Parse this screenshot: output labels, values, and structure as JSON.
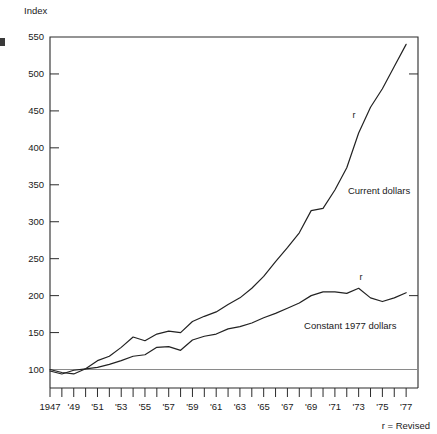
{
  "chart_data": {
    "type": "line",
    "title": "",
    "ylabel": "Index",
    "xlabel": "",
    "ylim": [
      75,
      550
    ],
    "yticks": [
      100,
      150,
      200,
      250,
      300,
      350,
      400,
      450,
      500,
      550
    ],
    "xlim": [
      1947,
      1978
    ],
    "xticks": [
      1947,
      1948,
      1949,
      1950,
      1951,
      1952,
      1953,
      1954,
      1955,
      1956,
      1957,
      1958,
      1959,
      1960,
      1961,
      1962,
      1963,
      1964,
      1965,
      1966,
      1967,
      1968,
      1969,
      1970,
      1971,
      1972,
      1973,
      1974,
      1975,
      1976,
      1977
    ],
    "xticklabels": [
      "1947",
      "",
      "'49",
      "",
      "'51",
      "",
      "'53",
      "",
      "'55",
      "",
      "'57",
      "",
      "'59",
      "",
      "'61",
      "",
      "'63",
      "",
      "'65",
      "",
      "'67",
      "",
      "'69",
      "",
      "'71",
      "",
      "'73",
      "",
      "'75",
      "",
      "'77"
    ],
    "grid": false,
    "baseline_value": 100,
    "legend_position": "inline-annotation",
    "annotations": [
      {
        "text": "Current dollars",
        "x": 1972.1,
        "y": 337,
        "name": "current-dollars-label"
      },
      {
        "text": "Constant 1977 dollars",
        "x": 1968.4,
        "y": 155,
        "name": "constant-dollars-label"
      },
      {
        "text": "r",
        "x": 1972.6,
        "y": 441,
        "name": "revised-flag-current"
      },
      {
        "text": "r",
        "x": 1973.2,
        "y": 221,
        "name": "revised-flag-constant"
      }
    ],
    "footnote": "r = Revised",
    "series": [
      {
        "name": "Current dollars",
        "x": [
          1947,
          1948,
          1949,
          1950,
          1951,
          1952,
          1953,
          1954,
          1955,
          1956,
          1957,
          1958,
          1959,
          1960,
          1961,
          1962,
          1963,
          1964,
          1965,
          1966,
          1967,
          1968,
          1969,
          1970,
          1971,
          1972,
          1973,
          1974,
          1975,
          1976,
          1977
        ],
        "values": [
          100,
          96,
          94,
          101,
          112,
          118,
          130,
          144,
          139,
          148,
          152,
          150,
          165,
          172,
          178,
          188,
          197,
          210,
          226,
          246,
          265,
          285,
          315,
          318,
          343,
          373,
          420,
          455,
          480,
          510,
          540
        ]
      },
      {
        "name": "Constant 1977 dollars",
        "x": [
          1947,
          1948,
          1949,
          1950,
          1951,
          1952,
          1953,
          1954,
          1955,
          1956,
          1957,
          1958,
          1959,
          1960,
          1961,
          1962,
          1963,
          1964,
          1965,
          1966,
          1967,
          1968,
          1969,
          1970,
          1971,
          1972,
          1973,
          1974,
          1975,
          1976,
          1977
        ],
        "values": [
          98,
          94,
          99,
          101,
          103,
          107,
          112,
          118,
          120,
          130,
          131,
          126,
          140,
          145,
          148,
          155,
          158,
          163,
          170,
          176,
          183,
          190,
          200,
          205,
          205,
          203,
          210,
          197,
          192,
          197,
          204
        ]
      }
    ]
  },
  "colors": {
    "line": "#222222",
    "axis": "#2b2b2b",
    "baseline": "#8a8a8a",
    "text": "#1a1a1a",
    "background": "#ffffff"
  }
}
